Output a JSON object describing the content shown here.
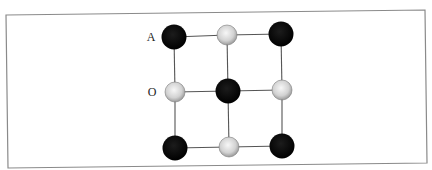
{
  "diagram": {
    "type": "lattice",
    "colors": {
      "frame": "#8a8a8a",
      "bond": "#555555",
      "black_atom": "#0a0a0a",
      "grey_atom_center": "#f4f4f4",
      "grey_atom_edge": "#9a9a9a"
    },
    "labels": [
      {
        "id": "A",
        "text": "A",
        "x": 151,
        "y": 41
      },
      {
        "id": "O",
        "text": "O",
        "x": 152,
        "y": 96
      }
    ],
    "atoms": [
      {
        "row": 0,
        "col": 0,
        "kind": "black",
        "x": 174,
        "y": 37,
        "r": 12.5
      },
      {
        "row": 0,
        "col": 1,
        "kind": "grey",
        "x": 227,
        "y": 35,
        "r": 10
      },
      {
        "row": 0,
        "col": 2,
        "kind": "black",
        "x": 281,
        "y": 34,
        "r": 12.5
      },
      {
        "row": 1,
        "col": 0,
        "kind": "grey",
        "x": 175,
        "y": 92,
        "r": 10
      },
      {
        "row": 1,
        "col": 1,
        "kind": "black",
        "x": 228,
        "y": 91,
        "r": 12.5
      },
      {
        "row": 1,
        "col": 2,
        "kind": "grey",
        "x": 282,
        "y": 90,
        "r": 10
      },
      {
        "row": 2,
        "col": 0,
        "kind": "black",
        "x": 175,
        "y": 148,
        "r": 12.5
      },
      {
        "row": 2,
        "col": 1,
        "kind": "grey",
        "x": 229,
        "y": 147,
        "r": 10
      },
      {
        "row": 2,
        "col": 2,
        "kind": "black",
        "x": 282,
        "y": 146,
        "r": 12.5
      }
    ],
    "frame": {
      "points": "6,15 425,10 427,163 8,168"
    }
  }
}
